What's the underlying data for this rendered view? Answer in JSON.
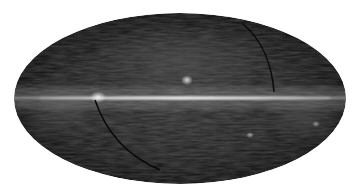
{
  "image": {
    "subject": "all-sky map",
    "projection": "Mollweide",
    "background_color": "#ffffff",
    "ellipse": {
      "cx": 180,
      "cy": 98.5,
      "rx": 166,
      "ry": 85.5
    },
    "colors": {
      "sky_dark": "#0b0b0b",
      "sky_mid": "#2a2a2a",
      "plane_glow": "#6e6e6e",
      "plane_core": "#e8e8e8",
      "arc": "#050505"
    },
    "features": [
      {
        "name": "galactic-plane",
        "y": 98,
        "x_start": 18,
        "x_end": 342
      },
      {
        "name": "bright-blob",
        "x": 187,
        "y": 80
      },
      {
        "name": "bright-patch-left",
        "x": 98,
        "y": 97
      },
      {
        "name": "spot-lower-right",
        "x": 250,
        "y": 135
      },
      {
        "name": "spot-far-right",
        "x": 316,
        "y": 124
      }
    ]
  }
}
